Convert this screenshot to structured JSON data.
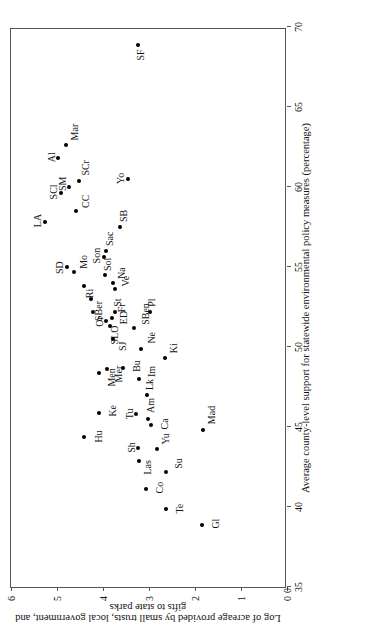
{
  "chart_data": {
    "type": "scatter",
    "title": "",
    "xlabel": "Average county-level support for statewide environmental policy measures (percentage)",
    "ylabel": "Log of acreage provided by small trusts, local government, and gifts to state parks",
    "xlim": [
      35,
      70
    ],
    "ylim": [
      0,
      6
    ],
    "xticks": [
      35,
      40,
      45,
      50,
      55,
      60,
      65,
      70
    ],
    "yticks": [
      0,
      1,
      2,
      3,
      4,
      5,
      6
    ],
    "grid": false,
    "legend": null,
    "origin_tick_label": "0",
    "points": [
      {
        "label": "SF",
        "x": 68.9,
        "y": 3.25
      },
      {
        "label": "Mar",
        "x": 62.6,
        "y": 4.8
      },
      {
        "label": "Al",
        "x": 61.8,
        "y": 4.98
      },
      {
        "label": "SCr",
        "x": 60.4,
        "y": 4.52
      },
      {
        "label": "SM",
        "x": 60.0,
        "y": 4.73
      },
      {
        "label": "SCl",
        "x": 59.6,
        "y": 4.92
      },
      {
        "label": "CC",
        "x": 58.5,
        "y": 4.58
      },
      {
        "label": "LA",
        "x": 57.8,
        "y": 5.26
      },
      {
        "label": "Yo",
        "x": 60.5,
        "y": 3.45
      },
      {
        "label": "SB",
        "x": 57.5,
        "y": 3.62
      },
      {
        "label": "Sac",
        "x": 56.0,
        "y": 3.93
      },
      {
        "label": "Son",
        "x": 55.6,
        "y": 3.98
      },
      {
        "label": "SD",
        "x": 55.0,
        "y": 4.78
      },
      {
        "label": "Mo",
        "x": 54.7,
        "y": 4.62
      },
      {
        "label": "Sol",
        "x": 54.5,
        "y": 3.96
      },
      {
        "label": "Na",
        "x": 54.0,
        "y": 3.78
      },
      {
        "label": "Ri",
        "x": 53.8,
        "y": 4.42
      },
      {
        "label": "Ve",
        "x": 53.6,
        "y": 3.75
      },
      {
        "label": "SBer",
        "x": 53.0,
        "y": 4.26
      },
      {
        "label": "St",
        "x": 52.2,
        "y": 3.74
      },
      {
        "label": "Or",
        "x": 52.2,
        "y": 4.22
      },
      {
        "label": "Fr",
        "x": 51.8,
        "y": 3.8
      },
      {
        "label": "SLO",
        "x": 51.6,
        "y": 3.94
      },
      {
        "label": "ED",
        "x": 51.3,
        "y": 3.84
      },
      {
        "label": "SBen",
        "x": 51.2,
        "y": 3.32
      },
      {
        "label": "SJ",
        "x": 50.5,
        "y": 3.78
      },
      {
        "label": "Ne",
        "x": 49.9,
        "y": 3.18
      },
      {
        "label": "Pl",
        "x": 52.2,
        "y": 2.98
      },
      {
        "label": "Men",
        "x": 48.4,
        "y": 4.08
      },
      {
        "label": "Mer",
        "x": 48.6,
        "y": 3.92
      },
      {
        "label": "Bu",
        "x": 48.7,
        "y": 3.56
      },
      {
        "label": "Im",
        "x": 48.0,
        "y": 3.22
      },
      {
        "label": "Lk",
        "x": 47.0,
        "y": 3.05
      },
      {
        "label": "Ki",
        "x": 49.3,
        "y": 2.66
      },
      {
        "label": "Ke",
        "x": 45.9,
        "y": 4.08
      },
      {
        "label": "Tu",
        "x": 45.8,
        "y": 3.28
      },
      {
        "label": "Am",
        "x": 45.5,
        "y": 3.02
      },
      {
        "label": "Ca",
        "x": 45.1,
        "y": 2.96
      },
      {
        "label": "Hu",
        "x": 44.4,
        "y": 4.42
      },
      {
        "label": "Sh",
        "x": 43.7,
        "y": 3.25
      },
      {
        "label": "Yu",
        "x": 43.6,
        "y": 2.82
      },
      {
        "label": "Mad",
        "x": 44.8,
        "y": 1.82
      },
      {
        "label": "Las",
        "x": 42.9,
        "y": 3.22
      },
      {
        "label": "Su",
        "x": 42.2,
        "y": 2.64
      },
      {
        "label": "Co",
        "x": 41.1,
        "y": 3.06
      },
      {
        "label": "Te",
        "x": 39.9,
        "y": 2.64
      },
      {
        "label": "Gl",
        "x": 38.9,
        "y": 1.85
      }
    ],
    "label_offsets": {
      "SF": [
        -16,
        -2
      ],
      "Mar": [
        5,
        4
      ],
      "Al": [
        -4,
        -11
      ],
      "SCr": [
        5,
        2
      ],
      "SM": [
        -4,
        -11
      ],
      "SCl": [
        -6,
        -12
      ],
      "CC": [
        3,
        5
      ],
      "LA": [
        -5,
        -12
      ],
      "Yo": [
        -5,
        -12
      ],
      "SB": [
        5,
        -1
      ],
      "Sac": [
        5,
        -1
      ],
      "Son": [
        -6,
        -12
      ],
      "SD": [
        -7,
        -12
      ],
      "Mo": [
        3,
        5
      ],
      "Sol": [
        4,
        -2
      ],
      "Na": [
        4,
        4
      ],
      "Ri": [
        -12,
        1
      ],
      "Ve": [
        3,
        6
      ],
      "SBer": [
        -22,
        3
      ],
      "St": [
        5,
        -2
      ],
      "Or": [
        -15,
        2
      ],
      "Fr": [
        6,
        5
      ],
      "SLO": [
        -23,
        4
      ],
      "ED": [
        2,
        9
      ],
      "SBen": [
        3,
        7
      ],
      "SJ": [
        -12,
        5
      ],
      "Ne": [
        5,
        6
      ],
      "Pl": [
        5,
        -3
      ],
      "Men": [
        -14,
        8
      ],
      "Mer": [
        -13,
        7
      ],
      "Bu": [
        -4,
        9
      ],
      "Im": [
        2,
        8
      ],
      "Lk": [
        5,
        -2
      ],
      "Ki": [
        5,
        4
      ],
      "Ke": [
        -4,
        9
      ],
      "Tu": [
        -5,
        -11
      ],
      "Am": [
        6,
        -2
      ],
      "Ca": [
        -4,
        9
      ],
      "Hu": [
        -6,
        10
      ],
      "Sh": [
        -5,
        -11
      ],
      "Yu": [
        5,
        4
      ],
      "Mad": [
        6,
        4
      ],
      "Las": [
        -14,
        4
      ],
      "Su": [
        3,
        8
      ],
      "Co": [
        -4,
        9
      ],
      "Te": [
        -5,
        9
      ],
      "Gl": [
        -4,
        9
      ]
    }
  }
}
